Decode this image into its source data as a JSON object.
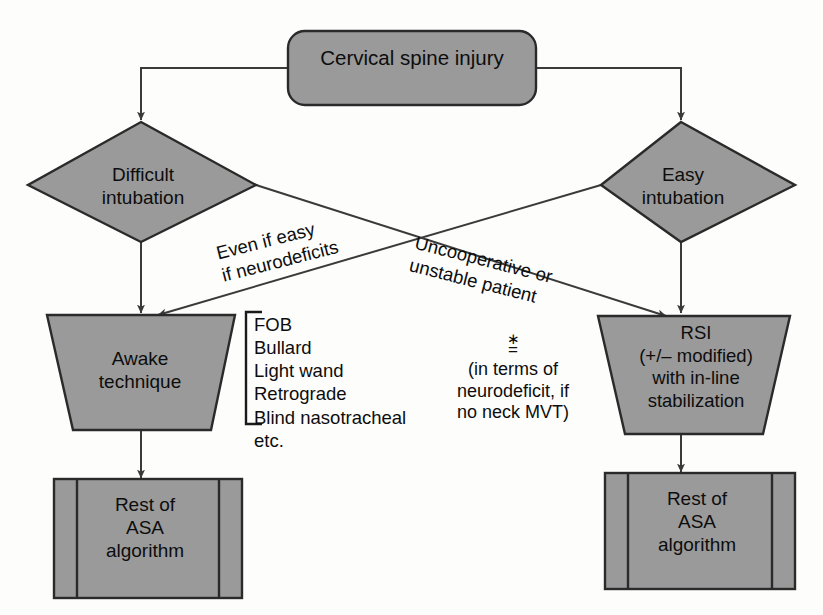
{
  "diagram": {
    "colors": {
      "shape_fill": "#9a9a9a",
      "shape_stroke": "#2a2a2a",
      "connector": "#3a3a3a",
      "text": "#0d0d0d",
      "background": "#fdfdfc"
    },
    "root": {
      "label": "Cervical spine injury",
      "shape": "rounded-rectangle"
    },
    "decisions": [
      {
        "id": "difficult",
        "label": "Difficult\nintubation",
        "shape": "diamond"
      },
      {
        "id": "easy",
        "label": "Easy\nintubation",
        "shape": "diamond"
      }
    ],
    "actions": [
      {
        "id": "awake",
        "label": "Awake\ntechnique",
        "shape": "inverted-trapezoid"
      },
      {
        "id": "rsi",
        "label": "RSI\n(+/– modified)\nwith in-line\nstabilization",
        "shape": "inverted-trapezoid"
      }
    ],
    "terminals": [
      {
        "id": "asa-left",
        "label": "Rest of\nASA\nalgorithm",
        "shape": "predefined-process"
      },
      {
        "id": "asa-right",
        "label": "Rest of\nASA\nalgorithm",
        "shape": "predefined-process"
      }
    ],
    "edge_labels": [
      {
        "id": "even-if-easy",
        "text": "Even if easy\nif neurodeficits",
        "from": "easy",
        "to": "awake"
      },
      {
        "id": "uncooperative",
        "text": "Uncooperative or\nunstable patient",
        "from": "difficult",
        "to": "rsi"
      }
    ],
    "technique_list": {
      "items": "FOB\nBullard\nLight wand\nRetrograde\nBlind nasotracheal\netc.",
      "bracket": "left-brace"
    },
    "footnote": {
      "mark_star": "∗",
      "mark_bar": "=",
      "text": "(in terms of\nneurodeficit, if\nno neck MVT)"
    }
  }
}
